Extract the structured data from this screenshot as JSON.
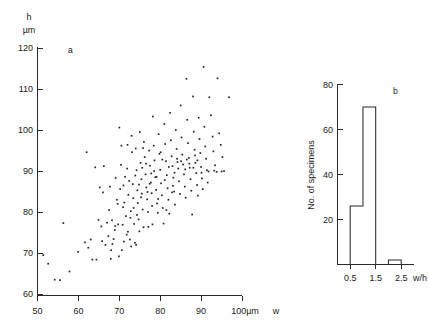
{
  "figure": {
    "background_color": "#ffffff",
    "ink_color": "#262626"
  },
  "chart_data": [
    {
      "type": "scatter",
      "panel_label": "a",
      "title": "",
      "xlabel": "w",
      "ylabel": "h",
      "x_unit": "100µm",
      "y_unit": "µm",
      "y_axis_header": "h",
      "xlim": [
        50,
        100
      ],
      "ylim": [
        60,
        120
      ],
      "xticks": [
        50,
        60,
        70,
        80,
        90,
        100
      ],
      "yticks": [
        60,
        70,
        80,
        90,
        100,
        110,
        120
      ],
      "xtick_labels": [
        "50",
        "60",
        "70",
        "80",
        "90",
        "100µm"
      ],
      "ytick_labels": [
        "60",
        "70",
        "80",
        "90",
        "100",
        "110",
        "120"
      ],
      "grid": false,
      "legend": false,
      "marker": "dot",
      "n_points": 205,
      "points": [
        [
          51.4,
          69.5
        ],
        [
          52.6,
          67.4
        ],
        [
          54.2,
          63.5
        ],
        [
          55.5,
          63.4
        ],
        [
          56.3,
          77.3
        ],
        [
          57.8,
          65.5
        ],
        [
          59.9,
          70.3
        ],
        [
          61.6,
          72.6
        ],
        [
          62.0,
          94.6
        ],
        [
          62.4,
          71.3
        ],
        [
          63.0,
          73.3
        ],
        [
          63.4,
          68.4
        ],
        [
          64.1,
          90.9
        ],
        [
          64.4,
          68.4
        ],
        [
          64.9,
          78.1
        ],
        [
          65.2,
          86.0
        ],
        [
          65.6,
          76.5
        ],
        [
          66.2,
          91.2
        ],
        [
          66.6,
          72.0
        ],
        [
          67.0,
          77.4
        ],
        [
          67.3,
          74.1
        ],
        [
          67.7,
          86.2
        ],
        [
          68.0,
          70.7
        ],
        [
          68.3,
          72.2
        ],
        [
          68.6,
          73.4
        ],
        [
          68.9,
          75.6
        ],
        [
          69.1,
          88.3
        ],
        [
          69.4,
          83.0
        ],
        [
          69.7,
          77.0
        ],
        [
          69.9,
          69.2
        ],
        [
          70.0,
          100.6
        ],
        [
          70.2,
          85.6
        ],
        [
          70.4,
          91.5
        ],
        [
          70.6,
          70.7
        ],
        [
          70.8,
          76.9
        ],
        [
          71.0,
          86.5
        ],
        [
          71.2,
          82.3
        ],
        [
          71.4,
          88.6
        ],
        [
          71.6,
          79.0
        ],
        [
          71.8,
          74.5
        ],
        [
          72.0,
          96.4
        ],
        [
          72.2,
          84.2
        ],
        [
          72.4,
          87.6
        ],
        [
          72.6,
          73.3
        ],
        [
          72.8,
          80.2
        ],
        [
          73.0,
          98.6
        ],
        [
          73.1,
          94.6
        ],
        [
          73.3,
          86.8
        ],
        [
          73.4,
          83.4
        ],
        [
          73.6,
          77.1
        ],
        [
          73.8,
          72.5
        ],
        [
          74.0,
          95.5
        ],
        [
          74.2,
          90.2
        ],
        [
          74.4,
          85.3
        ],
        [
          74.5,
          82.2
        ],
        [
          74.7,
          78.2
        ],
        [
          74.9,
          75.3
        ],
        [
          75.0,
          99.5
        ],
        [
          75.2,
          92.0
        ],
        [
          75.4,
          88.0
        ],
        [
          75.5,
          84.5
        ],
        [
          75.7,
          80.6
        ],
        [
          75.9,
          76.3
        ],
        [
          76.0,
          97.1
        ],
        [
          76.2,
          93.4
        ],
        [
          76.4,
          89.2
        ],
        [
          76.6,
          86.0
        ],
        [
          76.8,
          83.1
        ],
        [
          77.0,
          80.0
        ],
        [
          77.1,
          76.4
        ],
        [
          77.3,
          95.0
        ],
        [
          77.5,
          91.3
        ],
        [
          77.7,
          87.2
        ],
        [
          77.9,
          84.6
        ],
        [
          78.0,
          81.5
        ],
        [
          78.2,
          103.3
        ],
        [
          78.4,
          96.2
        ],
        [
          78.6,
          92.6
        ],
        [
          78.8,
          88.5
        ],
        [
          79.0,
          85.4
        ],
        [
          79.2,
          82.1
        ],
        [
          79.4,
          79.8
        ],
        [
          79.6,
          99.0
        ],
        [
          79.8,
          94.2
        ],
        [
          80.0,
          90.3
        ],
        [
          80.2,
          87.0
        ],
        [
          80.4,
          84.1
        ],
        [
          80.6,
          81.0
        ],
        [
          80.8,
          77.2
        ],
        [
          81.0,
          101.5
        ],
        [
          81.2,
          96.6
        ],
        [
          81.4,
          92.4
        ],
        [
          81.6,
          89.0
        ],
        [
          81.8,
          85.8
        ],
        [
          82.0,
          83.0
        ],
        [
          82.2,
          79.6
        ],
        [
          82.4,
          104.2
        ],
        [
          82.6,
          97.5
        ],
        [
          82.8,
          93.6
        ],
        [
          83.0,
          91.2
        ],
        [
          83.2,
          88.4
        ],
        [
          83.4,
          85.0
        ],
        [
          83.6,
          81.8
        ],
        [
          83.8,
          100.0
        ],
        [
          84.0,
          95.4
        ],
        [
          84.2,
          92.2
        ],
        [
          84.4,
          90.6
        ],
        [
          84.6,
          87.5
        ],
        [
          84.8,
          84.4
        ],
        [
          85.0,
          106.0
        ],
        [
          85.2,
          98.2
        ],
        [
          85.4,
          94.0
        ],
        [
          85.6,
          91.6
        ],
        [
          85.8,
          89.2
        ],
        [
          86.0,
          86.2
        ],
        [
          86.2,
          83.5
        ],
        [
          86.4,
          112.5
        ],
        [
          86.6,
          102.5
        ],
        [
          86.8,
          96.8
        ],
        [
          87.0,
          93.2
        ],
        [
          87.2,
          90.8
        ],
        [
          87.4,
          88.0
        ],
        [
          87.6,
          85.2
        ],
        [
          87.8,
          79.4
        ],
        [
          88.0,
          108.2
        ],
        [
          88.2,
          99.6
        ],
        [
          88.4,
          95.2
        ],
        [
          88.6,
          92.0
        ],
        [
          88.8,
          89.5
        ],
        [
          89.0,
          86.6
        ],
        [
          89.2,
          84.0
        ],
        [
          89.4,
          103.0
        ],
        [
          89.6,
          97.8
        ],
        [
          89.8,
          94.4
        ],
        [
          90.0,
          91.0
        ],
        [
          90.2,
          88.2
        ],
        [
          90.4,
          85.6
        ],
        [
          90.6,
          115.4
        ],
        [
          90.8,
          100.8
        ],
        [
          91.0,
          96.0
        ],
        [
          91.2,
          93.0
        ],
        [
          91.4,
          90.2
        ],
        [
          91.6,
          87.2
        ],
        [
          92.0,
          108.0
        ],
        [
          92.4,
          103.6
        ],
        [
          92.8,
          98.4
        ],
        [
          93.0,
          94.8
        ],
        [
          93.4,
          91.4
        ],
        [
          93.8,
          89.8
        ],
        [
          94.0,
          112.6
        ],
        [
          94.4,
          99.2
        ],
        [
          94.8,
          96.4
        ],
        [
          95.2,
          93.4
        ],
        [
          95.6,
          90.0
        ],
        [
          96.8,
          108.0
        ],
        [
          66.0,
          84.8
        ],
        [
          67.5,
          80.5
        ],
        [
          70.5,
          96.2
        ],
        [
          71.9,
          90.6
        ],
        [
          72.7,
          78.6
        ],
        [
          73.9,
          88.9
        ],
        [
          74.8,
          86.7
        ],
        [
          75.8,
          95.6
        ],
        [
          76.5,
          91.8
        ],
        [
          77.4,
          86.9
        ],
        [
          78.5,
          90.0
        ],
        [
          79.1,
          88.6
        ],
        [
          80.1,
          94.6
        ],
        [
          81.1,
          87.8
        ],
        [
          82.1,
          91.0
        ],
        [
          83.1,
          86.4
        ],
        [
          84.1,
          93.0
        ],
        [
          85.1,
          92.4
        ],
        [
          86.1,
          90.4
        ],
        [
          87.1,
          91.8
        ],
        [
          88.1,
          90.8
        ],
        [
          89.1,
          92.6
        ],
        [
          90.1,
          89.6
        ],
        [
          69.6,
          82.0
        ],
        [
          70.9,
          81.2
        ],
        [
          72.1,
          75.2
        ],
        [
          73.5,
          81.0
        ],
        [
          74.3,
          79.3
        ],
        [
          75.3,
          83.6
        ],
        [
          76.9,
          84.9
        ],
        [
          78.1,
          77.0
        ],
        [
          79.5,
          83.2
        ],
        [
          81.5,
          80.5
        ],
        [
          82.9,
          84.8
        ],
        [
          71.1,
          72.8
        ],
        [
          72.9,
          71.6
        ],
        [
          74.1,
          72.0
        ],
        [
          68.2,
          78.0
        ],
        [
          69.0,
          76.6
        ],
        [
          75.6,
          90.8
        ],
        [
          77.8,
          89.4
        ],
        [
          80.5,
          92.8
        ],
        [
          83.5,
          89.6
        ],
        [
          86.5,
          92.8
        ],
        [
          88.5,
          93.8
        ],
        [
          91.8,
          89.9
        ],
        [
          93.2,
          90.1
        ],
        [
          95.0,
          89.9
        ],
        [
          65.8,
          72.9
        ],
        [
          67.9,
          68.6
        ]
      ]
    },
    {
      "type": "bar",
      "panel_label": "b",
      "title": "",
      "xlabel": "w/h",
      "ylabel": "No. of specimens",
      "xlim": [
        0.0,
        3.0
      ],
      "ylim": [
        0,
        80
      ],
      "xticks": [
        0.5,
        1.5,
        2.5
      ],
      "xtick_labels": [
        "0.5",
        "1.5",
        "2.5"
      ],
      "yticks": [
        20,
        40,
        60,
        80
      ],
      "ytick_labels": [
        "20",
        "40",
        "60",
        "80"
      ],
      "grid": false,
      "legend": false,
      "bin_edges": [
        0.0,
        0.5,
        1.0,
        1.5,
        2.0,
        2.5,
        3.0
      ],
      "categories": [
        "0.0-0.5",
        "0.5-1.0",
        "1.0-1.5",
        "1.5-2.0",
        "2.0-2.5",
        "2.5-3.0"
      ],
      "values": [
        0,
        26,
        70,
        0,
        2,
        0
      ]
    }
  ]
}
